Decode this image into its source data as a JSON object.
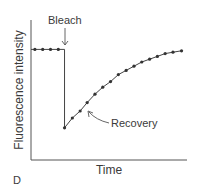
{
  "chart_data": {
    "type": "line",
    "title": "",
    "xlabel": "Time",
    "ylabel": "Fluorescence intensity",
    "panel_label": "D",
    "xlim": [
      0,
      20
    ],
    "ylim": [
      0,
      100
    ],
    "grid": false,
    "series": [
      {
        "name": "Before bleach",
        "x": [
          0.5,
          1.5,
          2.5,
          3.5,
          4.3
        ],
        "y": [
          79,
          79,
          79,
          79,
          79
        ]
      },
      {
        "name": "Recovery",
        "x": [
          4.3,
          5.3,
          6.3,
          7.2,
          8.2,
          9.2,
          10.2,
          11.2,
          12.2,
          13.2,
          14.2,
          15.2,
          16.2,
          17.2,
          18.2,
          19.3
        ],
        "y": [
          23,
          30,
          35,
          41,
          47,
          52,
          56,
          61,
          64,
          67,
          70,
          72,
          74,
          76,
          77,
          78
        ]
      }
    ],
    "annotations": [
      {
        "text": "Bleach",
        "points_to": "drop at bleach time"
      },
      {
        "text": "Recovery",
        "points_to": "recovery curve"
      }
    ]
  }
}
